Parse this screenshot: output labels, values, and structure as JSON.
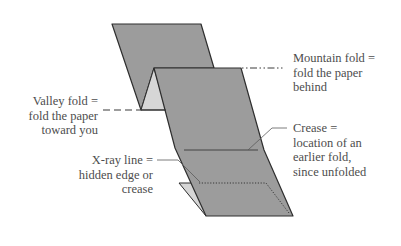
{
  "diagram": {
    "colors": {
      "paper_front": "#9c9c9c",
      "paper_back_light": "#d6d6d6",
      "outline": "#2e2e2e",
      "leader": "#5a5a5a",
      "text": "#4d4d4d"
    },
    "labels": {
      "mountain_fold": {
        "lines": [
          "Mountain fold =",
          "fold the paper",
          "behind"
        ]
      },
      "valley_fold": {
        "lines": [
          "Valley fold =",
          "fold the paper",
          "toward you"
        ]
      },
      "crease": {
        "lines": [
          "Crease =",
          "location of an",
          "earlier fold,",
          "since unfolded"
        ]
      },
      "xray_line": {
        "lines": [
          "X-ray line =",
          "hidden edge or",
          "crease"
        ]
      }
    },
    "legend_line_styles": {
      "mountain_fold": "dot-dot-dash",
      "valley_fold": "dashed",
      "crease": "thin solid",
      "xray_line": "dotted"
    }
  }
}
